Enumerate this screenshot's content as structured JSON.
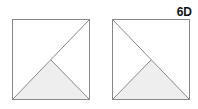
{
  "label": "6D",
  "figures": [
    {
      "name": "left-square",
      "diagonal": "bottom-left to top-right",
      "shaded": "bottom triangle"
    },
    {
      "name": "right-square",
      "diagonal": "top-left to bottom-right",
      "shaded": "bottom triangle"
    }
  ],
  "colors": {
    "stroke": "#888888",
    "fill": "#eeeeee"
  }
}
